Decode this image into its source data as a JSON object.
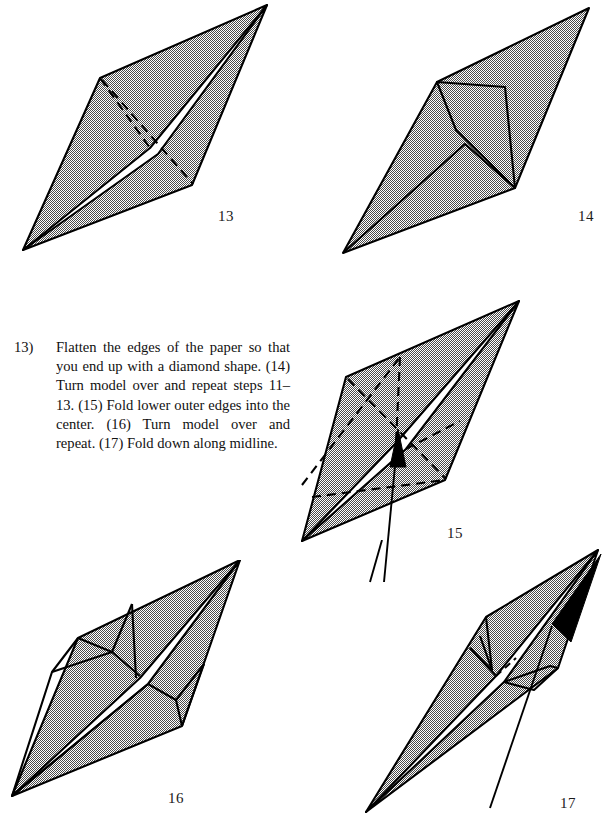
{
  "document": {
    "kind": "origami-instruction-page",
    "page_background": "#ffffff",
    "ink_color": "#000000",
    "shade_color": "#9a9a9a"
  },
  "instructions": {
    "step_number": "13)",
    "text": "Flatten the edges of the paper so that you end up with a diamond shape. (14) Turn model over and repeat steps 11–13. (15) Fold lower outer edges into the center. (16) Turn model over and repeat. (17) Fold down along midline."
  },
  "figures": [
    {
      "id": "figure-13",
      "label": "13",
      "caption_position": {
        "x": 218,
        "y": 208
      },
      "description": "Shaded diamond with white midline band and dashed fold creases crossing the center"
    },
    {
      "id": "figure-14",
      "label": "14",
      "caption_position": {
        "x": 578,
        "y": 208
      },
      "description": "Shaded diamond, reverse side, showing solid crease lines forming inner arrow-like flaps"
    },
    {
      "id": "figure-15",
      "label": "15",
      "caption_position": {
        "x": 447,
        "y": 525
      },
      "description": "Shaded diamond with white midline band, dashed fold lines and a long arrow pointing up into the center"
    },
    {
      "id": "figure-16",
      "label": "16",
      "caption_position": {
        "x": 168,
        "y": 790
      },
      "description": "Narrower shaded diamond with white midline band and solid creases on both halves"
    },
    {
      "id": "figure-17",
      "label": "17",
      "caption_position": {
        "x": 560,
        "y": 795
      },
      "description": "Slim shaded diamond folded along the midline with an arrow pointing up to the top tip"
    }
  ]
}
